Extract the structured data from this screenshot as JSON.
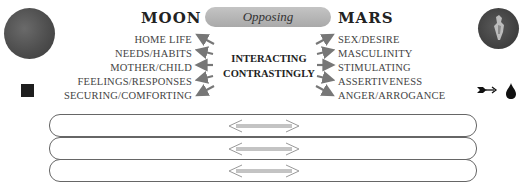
{
  "left": {
    "title": "MOON",
    "planet_image": "moon-image",
    "glyph": "square-glyph",
    "items": [
      "HOME LIFE",
      "NEEDS/HABITS",
      "MOTHER/CHILD",
      "FEELINGS/RESPONSES",
      "SECURING/COMFORTING"
    ]
  },
  "right": {
    "title": "MARS",
    "planet_image": "mars-image",
    "glyph": "arrow-and-drop-glyph",
    "items": [
      "SEX/DESIRE",
      "MASCULINITY",
      "STIMULATING",
      "ASSERTIVENESS",
      "ANGER/ARROGANCE"
    ]
  },
  "aspect": {
    "label": "Opposing"
  },
  "center": {
    "line1": "INTERACTING",
    "line2": "CONTRASTINGLY"
  },
  "bands": [
    {
      "icon": "double-arrow-icon"
    },
    {
      "icon": "double-arrow-icon"
    },
    {
      "icon": "double-arrow-icon"
    }
  ],
  "colors": {
    "pill": "#b5b5b5",
    "arrow": "#777777",
    "text": "#444444",
    "title": "#222222"
  }
}
